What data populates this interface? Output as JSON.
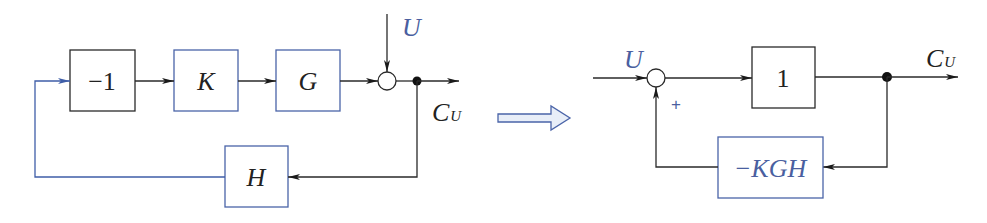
{
  "colors": {
    "blue_label": "#4a5fa0",
    "blue_border": "#4a64a8",
    "black_line": "#2a2a2a",
    "arrow_fill": "#e8eef8"
  },
  "left_diagram": {
    "blocks": [
      {
        "id": "neg-one",
        "label": "−1",
        "border": "black"
      },
      {
        "id": "K",
        "label": "K",
        "border": "blue"
      },
      {
        "id": "G",
        "label": "G",
        "border": "blue"
      },
      {
        "id": "H",
        "label": "H",
        "border": "blue"
      }
    ],
    "input_label": "U",
    "output_label_main": "C",
    "output_label_sub": "U"
  },
  "transform_arrow": {
    "meaning": "equivalent-to"
  },
  "right_diagram": {
    "blocks": [
      {
        "id": "one",
        "label": "1",
        "border": "black"
      },
      {
        "id": "neg-KGH",
        "label": "−KGH",
        "border": "blue"
      }
    ],
    "input_label": "U",
    "sum_sign": "+",
    "output_label_main": "C",
    "output_label_sub": "U"
  }
}
